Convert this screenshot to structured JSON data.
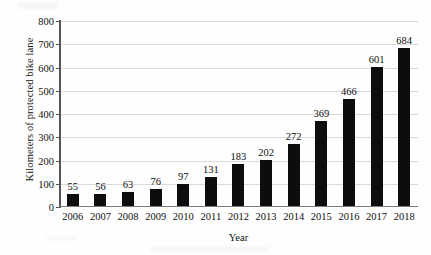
{
  "chart_data": {
    "type": "bar",
    "title": "",
    "xlabel": "Year",
    "ylabel": "Kilometers of protected bike lane",
    "categories": [
      "2006",
      "2007",
      "2008",
      "2009",
      "2010",
      "2011",
      "2012",
      "2013",
      "2014",
      "2015",
      "2016",
      "2017",
      "2018"
    ],
    "values": [
      55,
      56,
      63,
      76,
      97,
      131,
      183,
      202,
      272,
      369,
      466,
      601,
      684
    ],
    "value_labels": [
      "55",
      "56",
      "63",
      "76",
      "97",
      "131",
      "183",
      "202",
      "272",
      "369",
      "466",
      "601",
      "684"
    ],
    "ylim": [
      0,
      800
    ],
    "yticks": [
      0,
      100,
      200,
      300,
      400,
      500,
      600,
      700,
      800
    ],
    "ytick_labels": [
      "0",
      "100",
      "200",
      "300",
      "400",
      "500",
      "600",
      "700",
      "800"
    ],
    "grid": true,
    "legend": false,
    "bar_color": "#0d0d0d",
    "grid_color": "#d9d9d9",
    "axis_color": "#555555",
    "background": "#fefefe"
  }
}
